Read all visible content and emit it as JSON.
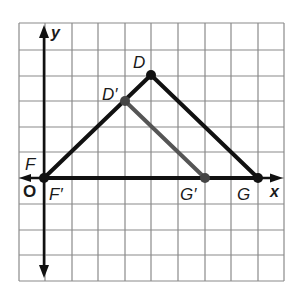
{
  "figure": {
    "grid": {
      "cols": 10,
      "rows": 10,
      "line_color": "#8a8a8a"
    },
    "axes": {
      "x_label": "x",
      "y_label": "y",
      "origin_label": "O"
    },
    "points": {
      "D": {
        "label": "D",
        "grid": [
          4,
          4
        ]
      },
      "D_prime": {
        "label": "D′",
        "grid": [
          3,
          3
        ]
      },
      "F": {
        "label": "F",
        "grid": [
          0,
          0
        ]
      },
      "F_prime": {
        "label": "F′",
        "grid": [
          0,
          0
        ]
      },
      "G": {
        "label": "G",
        "grid": [
          8,
          0
        ]
      },
      "G_prime": {
        "label": "G′",
        "grid": [
          6,
          0
        ]
      }
    },
    "triangles": [
      {
        "name": "DFG",
        "vertices": [
          "D",
          "F",
          "G"
        ],
        "color": "#111111"
      },
      {
        "name": "D'F'G'",
        "vertices": [
          "D′",
          "F′",
          "G′"
        ],
        "color": "#555555"
      }
    ]
  }
}
